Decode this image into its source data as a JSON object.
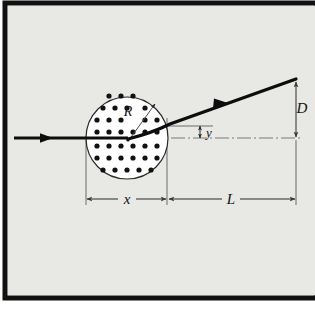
{
  "figure": {
    "background_color": "#e8e8e5",
    "frame_color": "#111111",
    "page_color": "#ffffff",
    "ray_color": "#0d0d0d",
    "dot_color": "#111111",
    "thin_line_color": "#5a5a5a",
    "disk_fill": "#ffffff",
    "disk_stroke": "#2a2a2a"
  },
  "labels": {
    "radius": "R",
    "horizontal_offset": "x",
    "drift_length": "L",
    "small_deflection": "y",
    "total_deflection": "D"
  },
  "geometry": {
    "disk_center_x": 127,
    "disk_center_y": 138,
    "disk_radius": 41,
    "incoming_ray_start_x": 14,
    "incoming_ray_y": 138,
    "scatter_point_x": 127,
    "scatter_point_y": 138,
    "outgoing_ray_end_x": 296,
    "outgoing_ray_end_y": 79,
    "dimension_line_y": 199,
    "x_left_tick": 86,
    "x_right_tick": 167,
    "L_right_tick": 296,
    "y_label_x": 205,
    "D_label_x": 289,
    "dot_rows": 7,
    "dot_spacing": 12
  },
  "dots": [
    {
      "x": 103,
      "y": 108
    },
    {
      "x": 115,
      "y": 108
    },
    {
      "x": 127,
      "y": 108
    },
    {
      "x": 139,
      "y": 108
    },
    {
      "x": 97,
      "y": 120
    },
    {
      "x": 109,
      "y": 120
    },
    {
      "x": 121,
      "y": 120
    },
    {
      "x": 133,
      "y": 120
    },
    {
      "x": 145,
      "y": 120
    },
    {
      "x": 157,
      "y": 120
    },
    {
      "x": 97,
      "y": 132
    },
    {
      "x": 109,
      "y": 132
    },
    {
      "x": 121,
      "y": 132
    },
    {
      "x": 133,
      "y": 132
    },
    {
      "x": 145,
      "y": 132
    },
    {
      "x": 157,
      "y": 132
    },
    {
      "x": 97,
      "y": 144
    },
    {
      "x": 109,
      "y": 144
    },
    {
      "x": 121,
      "y": 144
    },
    {
      "x": 133,
      "y": 144
    },
    {
      "x": 145,
      "y": 144
    },
    {
      "x": 157,
      "y": 144
    },
    {
      "x": 97,
      "y": 156
    },
    {
      "x": 109,
      "y": 156
    },
    {
      "x": 121,
      "y": 156
    },
    {
      "x": 133,
      "y": 156
    },
    {
      "x": 145,
      "y": 156
    },
    {
      "x": 157,
      "y": 156
    },
    {
      "x": 103,
      "y": 168
    },
    {
      "x": 115,
      "y": 168
    },
    {
      "x": 127,
      "y": 168
    },
    {
      "x": 139,
      "y": 168
    },
    {
      "x": 151,
      "y": 168
    },
    {
      "x": 109,
      "y": 96
    },
    {
      "x": 121,
      "y": 96
    },
    {
      "x": 133,
      "y": 96
    }
  ]
}
